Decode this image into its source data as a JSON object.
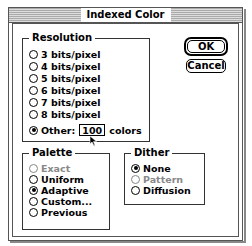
{
  "window": {
    "title": "Indexed Color"
  },
  "resolution": {
    "label": "Resolution",
    "options": [
      {
        "label": "3 bits/pixel",
        "selected": false
      },
      {
        "label": "4 bits/pixel",
        "selected": false
      },
      {
        "label": "5 bits/pixel",
        "selected": false
      },
      {
        "label": "6 bits/pixel",
        "selected": false
      },
      {
        "label": "7 bits/pixel",
        "selected": false
      },
      {
        "label": "8 bits/pixel",
        "selected": false
      }
    ],
    "other": {
      "label": "Other:",
      "value": "100",
      "suffix": "colors",
      "selected": true
    }
  },
  "buttons": {
    "ok": "OK",
    "cancel": "Cancel"
  },
  "palette": {
    "label": "Palette",
    "options": [
      {
        "label": "Exact",
        "selected": false,
        "disabled": true
      },
      {
        "label": "Uniform",
        "selected": false,
        "disabled": false
      },
      {
        "label": "Adaptive",
        "selected": true,
        "disabled": false
      },
      {
        "label": "Custom...",
        "selected": false,
        "disabled": false
      },
      {
        "label": "Previous",
        "selected": false,
        "disabled": false
      }
    ]
  },
  "dither": {
    "label": "Dither",
    "options": [
      {
        "label": "None",
        "selected": true,
        "disabled": false
      },
      {
        "label": "Pattern",
        "selected": false,
        "disabled": true
      },
      {
        "label": "Diffusion",
        "selected": false,
        "disabled": false
      }
    ]
  }
}
